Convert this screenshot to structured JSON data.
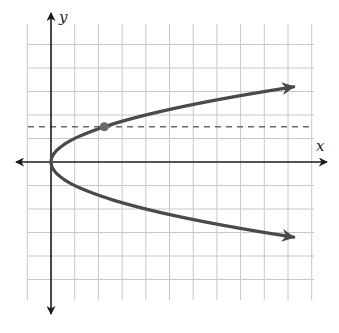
{
  "chart_data": {
    "type": "line",
    "title": "",
    "xlabel": "x",
    "ylabel": "y",
    "equation": "x = y^2",
    "xlim": [
      -1,
      11
    ],
    "ylim": [
      -5,
      5
    ],
    "grid": true,
    "series": [
      {
        "name": "parabola",
        "x": [
          11,
          9,
          6.25,
          4,
          2.25,
          1,
          0.25,
          0,
          0.25,
          1,
          2.25,
          4,
          6.25,
          9,
          11
        ],
        "y": [
          3.2,
          3,
          2.5,
          2,
          1.5,
          1,
          0.5,
          0,
          -0.5,
          -1,
          -1.5,
          -2,
          -2.5,
          -3,
          -3.2
        ],
        "color": "#4a4a4a",
        "arrows_at_ends": true
      }
    ],
    "annotations": [
      {
        "type": "horizontal_dashed_line",
        "y": 1.5,
        "color": "#6a6a6a"
      },
      {
        "type": "point",
        "x": 2.25,
        "y": 1.5,
        "color": "#6a6a6a"
      }
    ]
  },
  "axes": {
    "x_label": "x",
    "y_label": "y"
  },
  "colors": {
    "grid": "#c8c8c8",
    "axis": "#1a1a1a",
    "curve": "#4a4a4a",
    "dashed": "#707070",
    "point": "#6a6a6a"
  }
}
